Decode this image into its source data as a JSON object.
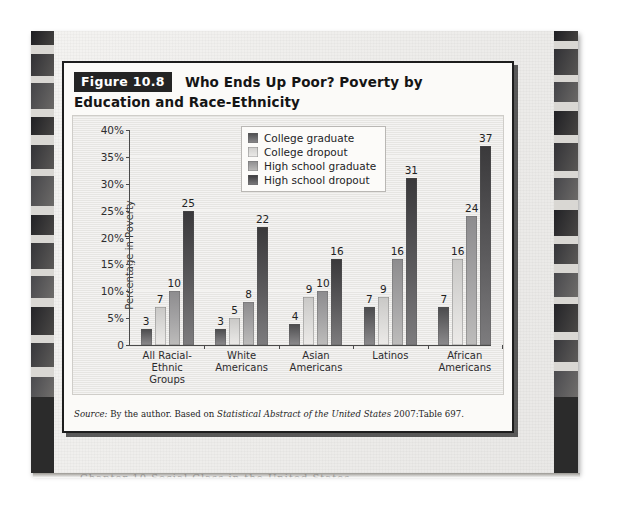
{
  "figure": {
    "number_label": "Figure 10.8",
    "title": "Who Ends Up Poor? Poverty by Education and Race-Ethnicity",
    "source_prefix": "Source:",
    "source_text_1": " By the author. Based on ",
    "source_italic": "Statistical Abstract of the United States",
    "source_text_2": " 2007:Table 697.",
    "page_cutoff_text": "Chapter 10 Social Class in the United States"
  },
  "colors": {
    "badge_background": "#242424",
    "badge_text": "#ffffff",
    "panel_background": "#e6e5e2",
    "frame": "#1d1d1d",
    "axis": "#4a4a4a",
    "series_college_graduate": "#6f6e70",
    "series_college_dropout": "#dedddb",
    "series_high_school_graduate": "#a6a5a6",
    "series_high_school_dropout": "#5c5b5d"
  },
  "chart_data": {
    "type": "bar",
    "title": "Who Ends Up Poor? Poverty by Education and Race-Ethnicity",
    "xlabel": "",
    "ylabel": "Percentage in Poverty",
    "ylim": [
      0,
      40
    ],
    "ytick_values": [
      0,
      5,
      10,
      15,
      20,
      25,
      30,
      35,
      40
    ],
    "ytick_labels": [
      "0",
      "5%",
      "10%",
      "15%",
      "20%",
      "25%",
      "30%",
      "35%",
      "40%"
    ],
    "grid": true,
    "legend_position": "upper-center",
    "value_labels": true,
    "categories": [
      "All Racial-Ethnic Groups",
      "White Americans",
      "Asian Americans",
      "Latinos",
      "African Americans"
    ],
    "category_lines": [
      [
        "All Racial-Ethnic",
        "Groups"
      ],
      [
        "White",
        "Americans"
      ],
      [
        "Asian",
        "Americans"
      ],
      [
        "Latinos",
        ""
      ],
      [
        "African",
        "Americans"
      ]
    ],
    "series": [
      {
        "name": "College graduate",
        "values": [
          3,
          3,
          4,
          7,
          7
        ]
      },
      {
        "name": "College dropout",
        "values": [
          7,
          5,
          9,
          9,
          16
        ]
      },
      {
        "name": "High school graduate",
        "values": [
          10,
          8,
          10,
          16,
          24
        ]
      },
      {
        "name": "High school dropout",
        "values": [
          25,
          22,
          16,
          31,
          37
        ]
      }
    ]
  }
}
